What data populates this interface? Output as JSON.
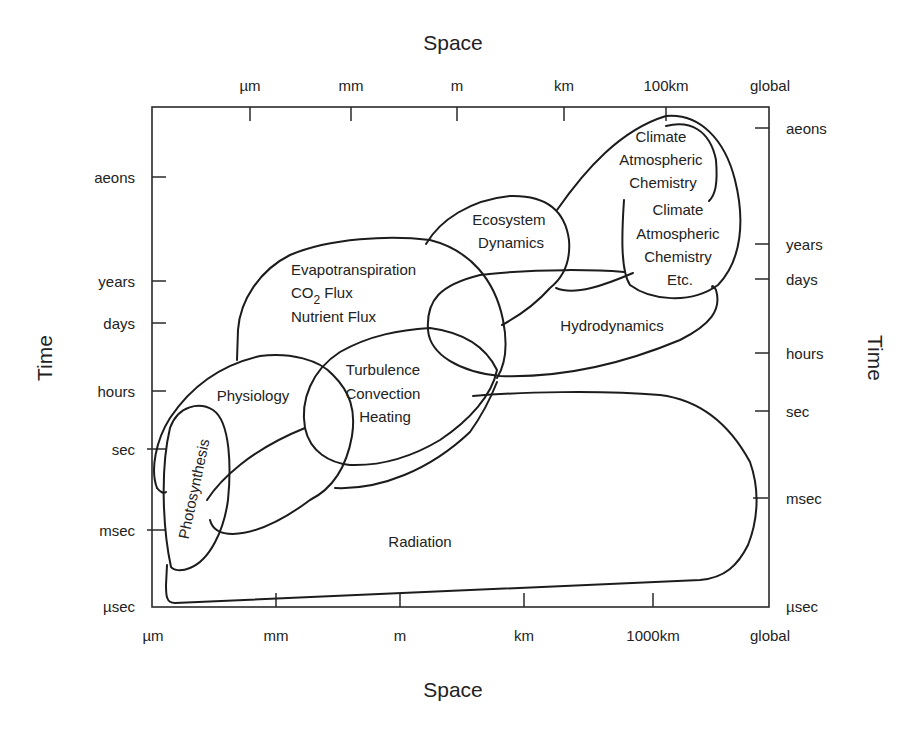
{
  "diagram": {
    "title_top": "Space",
    "title_bottom": "Space",
    "title_left": "Time",
    "title_right": "Time",
    "top_axis": {
      "ticks": [
        {
          "label": "µm",
          "x": 250
        },
        {
          "label": "mm",
          "x": 351
        },
        {
          "label": "m",
          "x": 457
        },
        {
          "label": "km",
          "x": 564
        },
        {
          "label": "100km",
          "x": 666
        },
        {
          "label": "global",
          "x": 770
        }
      ]
    },
    "bottom_axis": {
      "ticks": [
        {
          "label": "µm",
          "x": 153
        },
        {
          "label": "mm",
          "x": 276
        },
        {
          "label": "m",
          "x": 400
        },
        {
          "label": "km",
          "x": 524
        },
        {
          "label": "1000km",
          "x": 653
        },
        {
          "label": "global",
          "x": 770
        }
      ]
    },
    "left_axis": {
      "ticks": [
        {
          "label": "aeons",
          "y": 177
        },
        {
          "label": "years",
          "y": 281
        },
        {
          "label": "days",
          "y": 323
        },
        {
          "label": "hours",
          "y": 391
        },
        {
          "label": "sec",
          "y": 449
        },
        {
          "label": "msec",
          "y": 530
        },
        {
          "label": "µsec",
          "y": 606
        }
      ]
    },
    "right_axis": {
      "ticks": [
        {
          "label": "aeons",
          "y": 128
        },
        {
          "label": "years",
          "y": 244
        },
        {
          "label": "days",
          "y": 279
        },
        {
          "label": "hours",
          "y": 353
        },
        {
          "label": "sec",
          "y": 411
        },
        {
          "label": "msec",
          "y": 498
        },
        {
          "label": "µsec",
          "y": 606
        }
      ]
    },
    "regions": [
      {
        "id": "climate-upper",
        "lines": [
          "Climate",
          "Atmospheric",
          "Chemistry"
        ]
      },
      {
        "id": "climate-lower",
        "lines": [
          "Climate",
          "Atmospheric",
          "Chemistry",
          "Etc."
        ]
      },
      {
        "id": "ecosystem-dynamics",
        "lines": [
          "Ecosystem",
          "Dynamics"
        ]
      },
      {
        "id": "evapotranspiration",
        "lines": [
          "Evapotranspiration",
          "CO",
          "2",
          " Flux",
          "Nutrient Flux"
        ]
      },
      {
        "id": "hydrodynamics",
        "lines": [
          "Hydrodynamics"
        ]
      },
      {
        "id": "turbulence",
        "lines": [
          "Turbulence",
          "Convection",
          "Heating"
        ]
      },
      {
        "id": "physiology",
        "lines": [
          "Physiology"
        ]
      },
      {
        "id": "photosynthesis",
        "lines": [
          "Photosynthesis"
        ]
      },
      {
        "id": "radiation",
        "lines": [
          "Radiation"
        ]
      }
    ]
  }
}
